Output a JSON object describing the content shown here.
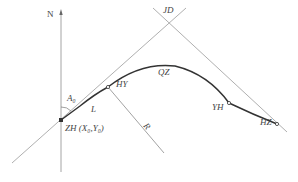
{
  "diagram": {
    "type": "road-curve-geometry",
    "labels": {
      "north": "N",
      "intersection": "JD",
      "azimuth": "A₀",
      "length": "L",
      "hy": "HY",
      "qz": "QZ",
      "yh": "YH",
      "hz": "HZ",
      "radius": "R",
      "zh": "ZH (X₀,Y₀)"
    },
    "points": {
      "ZH": [
        61,
        120
      ],
      "HY": [
        108,
        87
      ],
      "QZ": [
        165,
        68
      ],
      "YH": [
        229,
        103
      ],
      "HZ": [
        277,
        124
      ],
      "JD": [
        169,
        23
      ]
    },
    "colors": {
      "thin_line": "#9a9a9a",
      "curve": "#333333",
      "text": "#444444"
    }
  }
}
